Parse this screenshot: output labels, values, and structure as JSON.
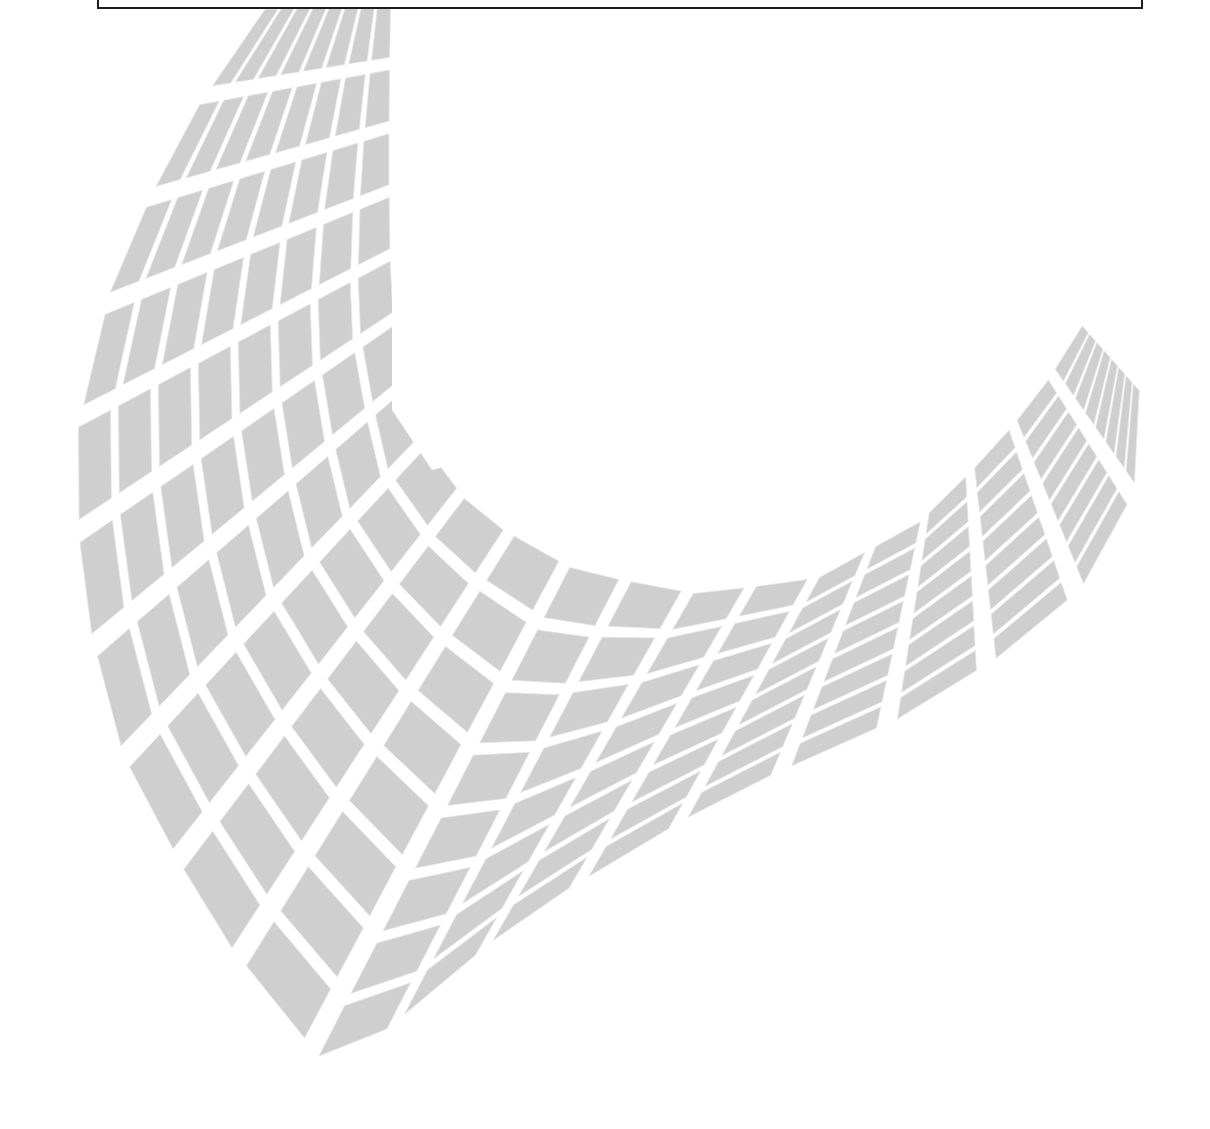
{
  "page": {
    "background": "#ffffff",
    "width": 1210,
    "height": 1129
  },
  "header_box": {
    "text": "",
    "border_color": "#1e1e1e",
    "left": 97,
    "right": 1141,
    "bottom": 9
  },
  "graphic": {
    "description": "Decorative gray tiled saddle surface (hyperbolic paraboloid grid)",
    "tile_color": "#cfcfcf",
    "tile_edge_color": "#e4e4e4",
    "gap_color": "#ffffff",
    "columns": 8,
    "rows": 20,
    "gap_ratio": 0.2,
    "inner_edge": [
      [
        392,
        0
      ],
      [
        392,
        160
      ],
      [
        395,
        300
      ],
      [
        420,
        430
      ],
      [
        480,
        510
      ],
      [
        580,
        565
      ],
      [
        700,
        590
      ],
      [
        820,
        575
      ],
      [
        920,
        520
      ],
      [
        990,
        450
      ],
      [
        1040,
        390
      ],
      [
        1085,
        320
      ]
    ],
    "outer_edge": [
      [
        270,
        0
      ],
      [
        180,
        130
      ],
      [
        110,
        280
      ],
      [
        72,
        440
      ],
      [
        78,
        600
      ],
      [
        120,
        760
      ],
      [
        210,
        930
      ],
      [
        330,
        1080
      ],
      [
        520,
        920
      ],
      [
        720,
        800
      ],
      [
        900,
        720
      ],
      [
        1030,
        640
      ],
      [
        1110,
        560
      ],
      [
        1140,
        470
      ],
      [
        1140,
        380
      ]
    ],
    "clip_right_x_top": 392,
    "clip_until_y": 470
  }
}
